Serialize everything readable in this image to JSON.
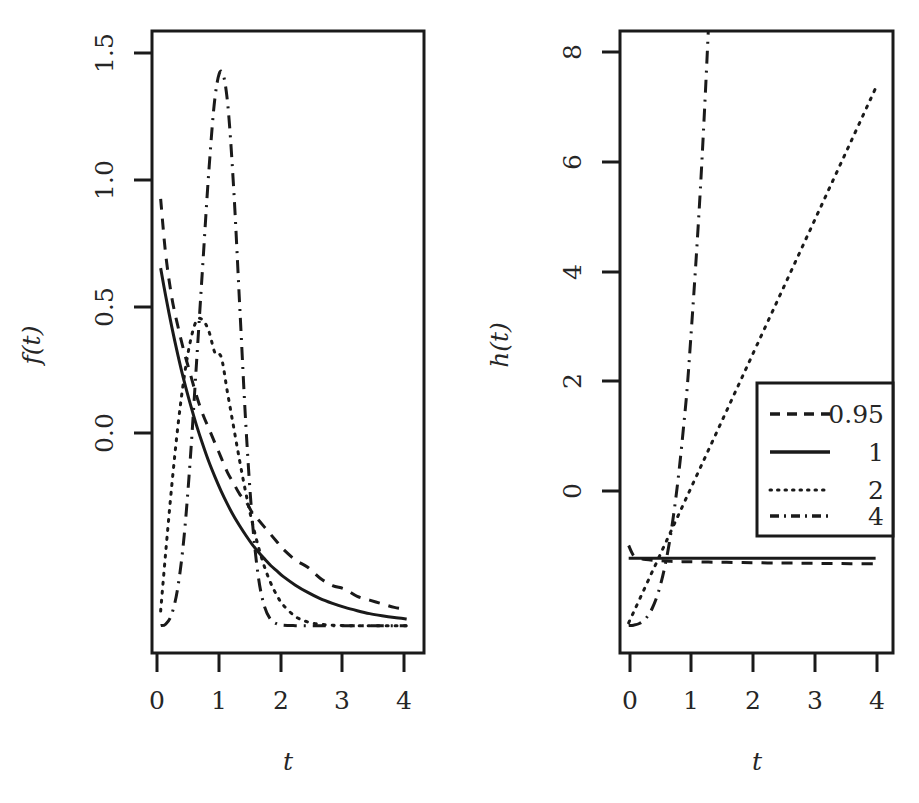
{
  "figure": {
    "background": "#ffffff",
    "ink": "#1a1a1a",
    "panel_count": 2
  },
  "chart_data": [
    {
      "id": "density-panel",
      "type": "line",
      "title": "",
      "xlabel": "t",
      "ylabel": "f(t)",
      "xlim": [
        -0.12,
        4.28
      ],
      "ylim": [
        -0.075,
        1.63
      ],
      "xticks": [
        0,
        1,
        2,
        3,
        4
      ],
      "xticklabels": [
        "0",
        "1",
        "2",
        "3",
        "4"
      ],
      "yticks": [
        0.0,
        0.5,
        1.0,
        1.5
      ],
      "yticklabels": [
        "0.0",
        "0.5",
        "1.0",
        "1.5"
      ],
      "grid": false,
      "legend": false,
      "x": [
        0.02,
        0.1,
        0.2,
        0.3,
        0.4,
        0.5,
        0.6,
        0.7,
        0.8,
        0.9,
        1.0,
        1.1,
        1.2,
        1.3,
        1.4,
        1.5,
        1.6,
        1.7,
        1.8,
        1.9,
        2.0,
        2.2,
        2.4,
        2.6,
        2.8,
        3.0,
        3.2,
        3.4,
        3.6,
        3.8,
        4.0
      ],
      "series": [
        {
          "name": "0.95",
          "style": "dashed",
          "values": [
            1.17,
            1.02,
            0.9,
            0.82,
            0.75,
            0.69,
            0.63,
            0.58,
            0.54,
            0.5,
            0.46,
            0.42,
            0.39,
            0.36,
            0.34,
            0.31,
            0.29,
            0.27,
            0.25,
            0.23,
            0.21,
            0.18,
            0.16,
            0.13,
            0.11,
            0.1,
            0.08,
            0.07,
            0.06,
            0.05,
            0.045
          ]
        },
        {
          "name": "1",
          "style": "solid",
          "values": [
            0.98,
            0.905,
            0.819,
            0.741,
            0.67,
            0.607,
            0.549,
            0.497,
            0.449,
            0.407,
            0.368,
            0.333,
            0.301,
            0.273,
            0.247,
            0.223,
            0.202,
            0.183,
            0.165,
            0.15,
            0.135,
            0.111,
            0.091,
            0.074,
            0.061,
            0.05,
            0.041,
            0.033,
            0.027,
            0.022,
            0.018
          ]
        },
        {
          "name": "2",
          "style": "dotted",
          "values": [
            0.04,
            0.198,
            0.384,
            0.548,
            0.681,
            0.779,
            0.836,
            0.838,
            0.807,
            0.747,
            0.736,
            0.64,
            0.545,
            0.45,
            0.362,
            0.284,
            0.217,
            0.161,
            0.117,
            0.083,
            0.057,
            0.025,
            0.01,
            0.004,
            0.001,
            0.0,
            0.0,
            0.0,
            0.0,
            0.0,
            0.0
          ]
        },
        {
          "name": "4",
          "style": "dashdot",
          "values": [
            0.0,
            0.004,
            0.032,
            0.107,
            0.246,
            0.458,
            0.72,
            0.986,
            1.247,
            1.449,
            1.52,
            1.438,
            1.202,
            0.873,
            0.545,
            0.294,
            0.134,
            0.052,
            0.017,
            0.005,
            0.001,
            0.0,
            0.0,
            0.0,
            0.0,
            0.0,
            0.0,
            0.0,
            0.0,
            0.0,
            0.0
          ]
        }
      ]
    },
    {
      "id": "hazard-panel",
      "type": "line",
      "title": "",
      "xlabel": "t",
      "ylabel": "h(t)",
      "xlim": [
        -0.12,
        4.28
      ],
      "ylim": [
        -0.41,
        8.85
      ],
      "xticks": [
        0,
        1,
        2,
        3,
        4
      ],
      "xticklabels": [
        "0",
        "1",
        "2",
        "3",
        "4"
      ],
      "yticks": [
        0,
        2,
        4,
        6,
        8
      ],
      "yticklabels": [
        "0",
        "2",
        "4",
        "6",
        "8"
      ],
      "grid": false,
      "legend": true,
      "legend_position": "center-right",
      "legend_title": "",
      "x": [
        0.02,
        0.1,
        0.2,
        0.3,
        0.4,
        0.5,
        0.6,
        0.7,
        0.8,
        0.9,
        1.0,
        1.2,
        1.4,
        1.6,
        1.8,
        2.0,
        2.4,
        2.8,
        3.2,
        3.6,
        4.0
      ],
      "series": [
        {
          "name": "0.95",
          "style": "dashed",
          "values": [
            1.19,
            1.04,
            1.0,
            0.98,
            0.97,
            0.965,
            0.96,
            0.955,
            0.952,
            0.95,
            0.95,
            0.945,
            0.942,
            0.94,
            0.937,
            0.935,
            0.93,
            0.927,
            0.923,
            0.92,
            0.918
          ]
        },
        {
          "name": "1",
          "style": "solid",
          "values": [
            1.0,
            1.0,
            1.0,
            1.0,
            1.0,
            1.0,
            1.0,
            1.0,
            1.0,
            1.0,
            1.0,
            1.0,
            1.0,
            1.0,
            1.0,
            1.0,
            1.0,
            1.0,
            1.0,
            1.0,
            1.0
          ]
        },
        {
          "name": "2",
          "style": "dotted",
          "values": [
            0.04,
            0.2,
            0.4,
            0.6,
            0.8,
            1.0,
            1.2,
            1.4,
            1.6,
            1.8,
            2.0,
            2.4,
            2.8,
            3.2,
            3.6,
            4.0,
            4.8,
            5.6,
            6.4,
            7.2,
            8.0
          ]
        },
        {
          "name": "4",
          "style": "dashdot",
          "values": [
            0.0,
            0.004,
            0.032,
            0.108,
            0.256,
            0.5,
            0.864,
            1.372,
            2.048,
            2.916,
            4.0,
            6.91,
            10.98,
            16.38,
            23.33,
            32.0,
            55.3,
            87.81,
            131.07,
            186.62,
            256.0
          ]
        }
      ]
    }
  ],
  "panels": [
    {
      "name": "left-density-panel",
      "ylabel": "f(t)",
      "xlabel": "t",
      "yticklabels": [
        "0.0",
        "0.5",
        "1.0",
        "1.5"
      ],
      "xticklabels": [
        "0",
        "1",
        "2",
        "3",
        "4"
      ]
    },
    {
      "name": "right-hazard-panel",
      "ylabel": "h(t)",
      "xlabel": "t",
      "yticklabels": [
        "0",
        "2",
        "4",
        "6",
        "8"
      ],
      "xticklabels": [
        "0",
        "1",
        "2",
        "3",
        "4"
      ]
    }
  ],
  "legend": {
    "entries": [
      {
        "label": "0.95",
        "style": "dashed"
      },
      {
        "label": "1",
        "style": "solid"
      },
      {
        "label": "2",
        "style": "dotted"
      },
      {
        "label": "4",
        "style": "dashdot"
      }
    ]
  }
}
